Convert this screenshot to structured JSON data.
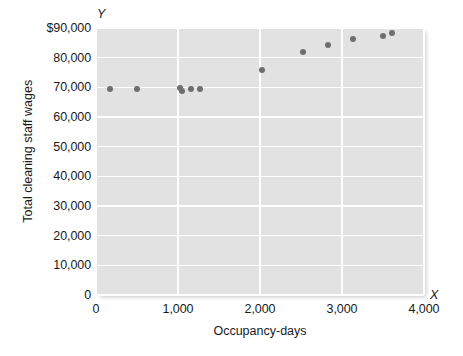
{
  "chart_data": {
    "type": "scatter",
    "title": "",
    "xlabel": "Occupancy-days",
    "ylabel": "Total cleaning staff wages",
    "x_axis_letter": "X",
    "y_axis_letter": "Y",
    "xlim": [
      0,
      4000
    ],
    "ylim": [
      0,
      90000
    ],
    "grid": true,
    "legend": null,
    "xticks": [
      {
        "value": 0,
        "label": "0"
      },
      {
        "value": 1000,
        "label": "1,000"
      },
      {
        "value": 2000,
        "label": "2,000"
      },
      {
        "value": 3000,
        "label": "3,000"
      },
      {
        "value": 4000,
        "label": "4,000"
      }
    ],
    "yticks": [
      {
        "value": 0,
        "label": "0"
      },
      {
        "value": 10000,
        "label": "10,000"
      },
      {
        "value": 20000,
        "label": "20,000"
      },
      {
        "value": 30000,
        "label": "30,000"
      },
      {
        "value": 40000,
        "label": "40,000"
      },
      {
        "value": 50000,
        "label": "50,000"
      },
      {
        "value": 60000,
        "label": "60,000"
      },
      {
        "value": 70000,
        "label": "70,000"
      },
      {
        "value": 80000,
        "label": "80,000"
      },
      {
        "value": 90000,
        "label": "$90,000"
      }
    ],
    "points": [
      {
        "x": 170,
        "y": 69300
      },
      {
        "x": 500,
        "y": 69500
      },
      {
        "x": 1025,
        "y": 69900
      },
      {
        "x": 1050,
        "y": 68900
      },
      {
        "x": 1160,
        "y": 69400
      },
      {
        "x": 1270,
        "y": 69500
      },
      {
        "x": 2020,
        "y": 76000
      },
      {
        "x": 2530,
        "y": 81900
      },
      {
        "x": 2830,
        "y": 84200
      },
      {
        "x": 3130,
        "y": 86200
      },
      {
        "x": 3500,
        "y": 87300
      },
      {
        "x": 3610,
        "y": 88400
      }
    ],
    "colors": {
      "point": "#6e6e6e",
      "panel": "#e2e2e2",
      "gridline": "#ffffff",
      "text": "#1a1a1a"
    }
  }
}
